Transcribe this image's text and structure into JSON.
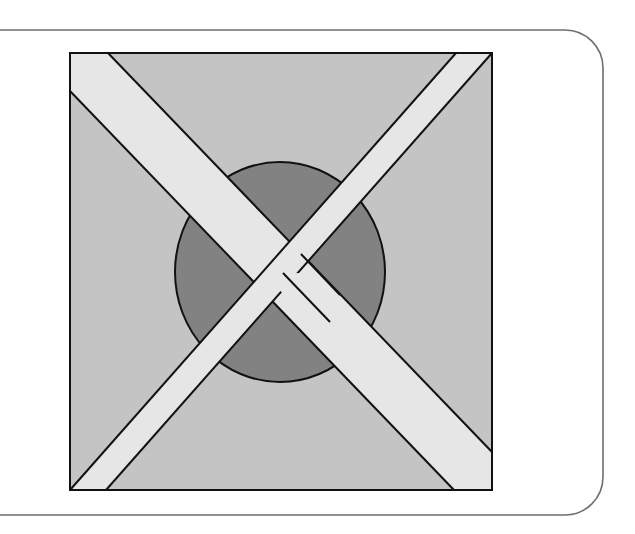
{
  "figure": {
    "colors": {
      "background": "#ffffff",
      "frame_stroke": "#6e6e6e",
      "square_fill": "#c4c4c4",
      "circle_fill": "#828282",
      "band_fill": "#e6e6e6",
      "outline": "#111111"
    },
    "frame": {
      "top_y": 30,
      "bottom_y": 515,
      "right_x": 603,
      "corner_radius": 38
    },
    "square": {
      "x": 70,
      "y": 53,
      "width": 422,
      "height": 437
    },
    "circle": {
      "cx": 280,
      "cy": 272,
      "rx": 105,
      "ry": 110
    },
    "bands": [
      {
        "name": "band-top-left-to-bottom-right",
        "width": 36
      },
      {
        "name": "band-top-right-to-bottom-left",
        "width": 36
      }
    ]
  }
}
